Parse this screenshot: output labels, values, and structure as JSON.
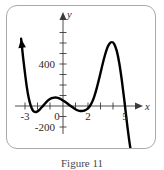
{
  "figure": {
    "caption": "Figure 11",
    "frame_color": "#a9a9a9",
    "curve_color": "#000000",
    "axis_color": "#3a3a3a"
  },
  "chart_data": {
    "type": "line",
    "title": "",
    "subtitle": "",
    "xlabel": "x",
    "ylabel": "y",
    "xlim": [
      -3.6,
      6.0
    ],
    "ylim": [
      -320,
      700
    ],
    "grid": false,
    "legend": null,
    "x_tick_labels": [
      "-3",
      "0",
      "2",
      "5"
    ],
    "x_tick_values": [
      -3,
      0,
      2,
      5
    ],
    "x_minor_ticks": [
      -3,
      -2,
      -1,
      1,
      2,
      3,
      4,
      5
    ],
    "y_tick_labels": [
      "400",
      "-200"
    ],
    "y_tick_values": [
      400,
      -200
    ],
    "y_minor_ticks": [
      -200,
      -100,
      100,
      200,
      300,
      400,
      500,
      600
    ],
    "arrow_start": "up-left",
    "arrow_end": "down-right",
    "annotations": [],
    "series": [
      {
        "name": "polynomial",
        "x": [
          -3.35,
          -3.2,
          -3.05,
          -2.9,
          -2.75,
          -2.6,
          -2.45,
          -2.3,
          -2.1,
          -1.9,
          -1.7,
          -1.5,
          -1.3,
          -1.1,
          -0.9,
          -0.7,
          -0.5,
          -0.3,
          -0.1,
          0.1,
          0.3,
          0.5,
          0.7,
          0.9,
          1.1,
          1.3,
          1.5,
          1.7,
          1.9,
          2.1,
          2.3,
          2.5,
          2.7,
          2.9,
          3.1,
          3.3,
          3.5,
          3.7,
          3.9,
          4.1,
          4.3,
          4.5,
          4.7,
          4.9,
          5.1,
          5.3,
          5.5,
          5.6
        ],
        "y": [
          640,
          470,
          320,
          185,
          80,
          10,
          -35,
          -55,
          -55,
          -38,
          -12,
          15,
          42,
          62,
          74,
          80,
          80,
          72,
          60,
          45,
          28,
          10,
          -8,
          -24,
          -38,
          -46,
          -48,
          -44,
          -32,
          -10,
          30,
          90,
          170,
          265,
          365,
          460,
          540,
          590,
          608,
          590,
          525,
          410,
          250,
          60,
          -145,
          -330,
          -480,
          -540
        ]
      }
    ]
  },
  "axis_labels": {
    "y_axis_name": "y",
    "x_axis_name": "x",
    "origin_label": "0",
    "x_neg3": "-3",
    "x_2": "2",
    "x_5": "5",
    "y_400": "400",
    "y_neg200": "-200"
  }
}
